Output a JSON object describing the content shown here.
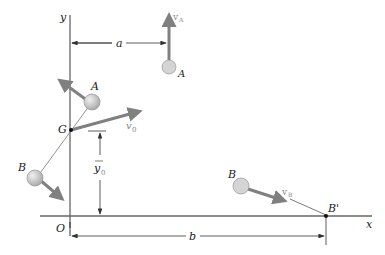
{
  "diagram": {
    "axes": {
      "x_label": "x",
      "y_label": "y",
      "origin_label": "O"
    },
    "points": {
      "A_initial": "A",
      "A_final": "A",
      "B_initial": "B",
      "B_moving": "B",
      "B_final": "B'",
      "center": "G"
    },
    "vectors": {
      "v_A": {
        "base": "v",
        "sub": "A"
      },
      "v_B": {
        "base": "v",
        "sub": "B"
      },
      "v_0": {
        "base": "v",
        "sub": "0"
      }
    },
    "dimensions": {
      "a": "a",
      "b": "b",
      "y0": {
        "base": "y",
        "sub": "0"
      }
    },
    "colors": {
      "axis": "#555555",
      "arrow": "#808080",
      "sphere": "#c8c8c8",
      "sphere_edge": "#8a8a8a"
    }
  }
}
